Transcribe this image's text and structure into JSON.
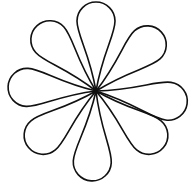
{
  "figure": {
    "title": "Flower of eight teardrop petals",
    "center": [
      96,
      91
    ],
    "stroke_color": "#111111",
    "fill_color": "#ffffff",
    "stroke_width": 1.6,
    "petals": [
      {
        "name": "up",
        "angle": -90,
        "length": 89,
        "width": 38
      },
      {
        "name": "upper-right",
        "angle": -42,
        "length": 88,
        "width": 38
      },
      {
        "name": "right",
        "angle": 8,
        "length": 92,
        "width": 38
      },
      {
        "name": "lower-right",
        "angle": 40,
        "length": 88,
        "width": 38
      },
      {
        "name": "down",
        "angle": 93,
        "length": 90,
        "width": 38
      },
      {
        "name": "lower-left",
        "angle": 140,
        "length": 88,
        "width": 38
      },
      {
        "name": "left",
        "angle": 183,
        "length": 88,
        "width": 38
      },
      {
        "name": "upper-left",
        "angle": 228,
        "length": 88,
        "width": 38
      }
    ]
  }
}
